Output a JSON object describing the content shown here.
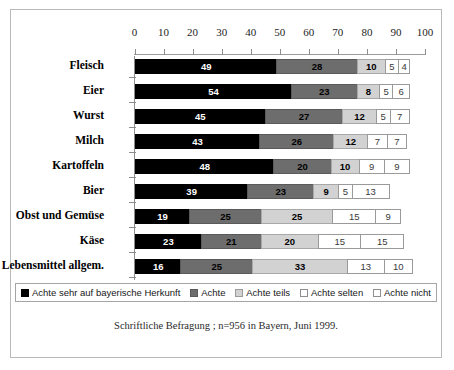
{
  "chart_data": {
    "type": "bar",
    "orientation": "horizontal",
    "stacked": true,
    "title": "",
    "xlabel": "",
    "ylabel": "",
    "xlim": [
      0,
      100
    ],
    "xticks": [
      0,
      10,
      20,
      30,
      40,
      50,
      60,
      70,
      80,
      90,
      100
    ],
    "grid": false,
    "legend_position": "bottom",
    "categories": [
      "Fleisch",
      "Eier",
      "Wurst",
      "Milch",
      "Kartoffeln",
      "Bier",
      "Obst und Gemüse",
      "Käse",
      "Lebensmittel allgem."
    ],
    "series": [
      {
        "name": "Achte sehr auf bayerische Herkunft",
        "color": "#000000",
        "values": [
          49,
          54,
          45,
          43,
          48,
          39,
          19,
          23,
          16
        ]
      },
      {
        "name": "Achte",
        "color": "#6d6d6d",
        "values": [
          28,
          23,
          27,
          26,
          20,
          23,
          25,
          21,
          25
        ]
      },
      {
        "name": "Achte teils",
        "color": "#d2d2d2",
        "values": [
          10,
          8,
          12,
          12,
          10,
          9,
          25,
          20,
          33
        ]
      },
      {
        "name": "Achte selten",
        "color": "#ffffff",
        "values": [
          5,
          5,
          5,
          7,
          9,
          5,
          15,
          15,
          13
        ]
      },
      {
        "name": "Achte nicht",
        "color": "#ffffff",
        "values": [
          4,
          6,
          7,
          7,
          9,
          13,
          9,
          15,
          10
        ]
      }
    ],
    "footnote": "Schriftliche Befragung ; n=956 in Bayern, Juni 1999."
  }
}
